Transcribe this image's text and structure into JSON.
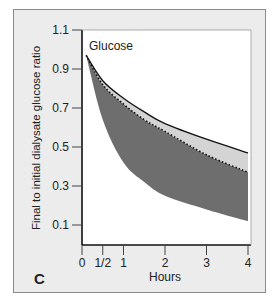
{
  "chart_data": {
    "type": "area",
    "title": "",
    "panel_label": "C",
    "annotation": "Glucose",
    "xlabel": "Hours",
    "ylabel": "Final to initial dialysate glucose ratio",
    "xlim": [
      0,
      4
    ],
    "ylim": [
      0,
      1.1
    ],
    "x_ticks": [
      "0",
      "1/2",
      "1",
      "2",
      "3",
      "4"
    ],
    "x_tick_values": [
      0,
      0.5,
      1,
      2,
      3,
      4
    ],
    "y_ticks": [
      "0.1",
      "0.3",
      "0.5",
      "0.7",
      "0.9",
      "1.1"
    ],
    "y_tick_values": [
      0.1,
      0.3,
      0.5,
      0.7,
      0.9,
      1.1
    ],
    "grid": false,
    "x": [
      0.1,
      0.5,
      1,
      1.5,
      2,
      3,
      4
    ],
    "series": [
      {
        "name": "Upper bound (solid line)",
        "style": "solid",
        "values": [
          0.97,
          0.84,
          0.75,
          0.68,
          0.62,
          0.54,
          0.47
        ]
      },
      {
        "name": "Mean (dotted line)",
        "style": "dotted",
        "values": [
          0.97,
          0.82,
          0.72,
          0.64,
          0.58,
          0.46,
          0.37
        ]
      },
      {
        "name": "Lower bound (dark band bottom)",
        "style": "area",
        "values": [
          0.97,
          0.64,
          0.42,
          0.32,
          0.25,
          0.18,
          0.12
        ]
      }
    ],
    "bands": [
      {
        "name": "light band",
        "between": [
          "Upper bound (solid line)",
          "Mean (dotted line)"
        ],
        "color": "#d4d4d4"
      },
      {
        "name": "dark band",
        "between": [
          "Mean (dotted line)",
          "Lower bound (dark band bottom)"
        ],
        "color": "#6e6e6e"
      }
    ]
  }
}
